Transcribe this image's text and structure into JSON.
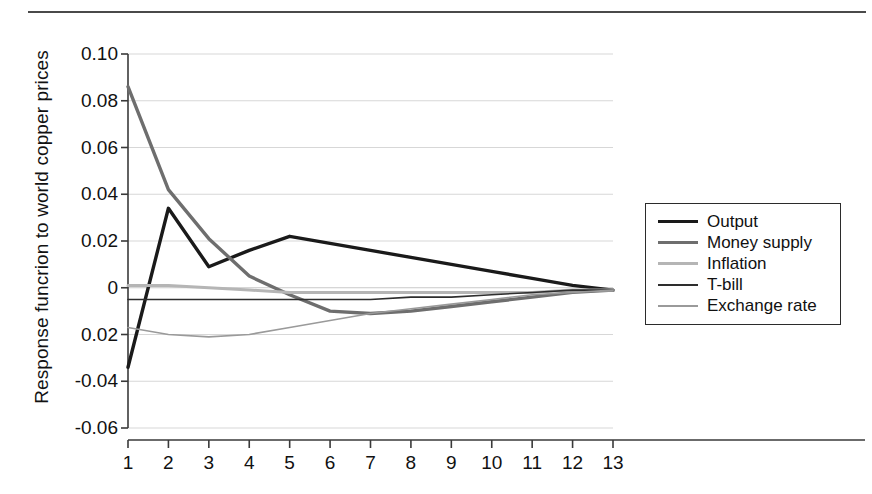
{
  "chart_data": {
    "type": "line",
    "title": "",
    "xlabel": "",
    "ylabel": "Response funcrion to world copper prices",
    "xlim": [
      1,
      13
    ],
    "ylim": [
      -0.06,
      0.1
    ],
    "grid": true,
    "legend_position": "right",
    "x": [
      1,
      2,
      3,
      4,
      5,
      6,
      7,
      8,
      9,
      10,
      11,
      12,
      13
    ],
    "xtick_labels": [
      "1",
      "2",
      "3",
      "4",
      "5",
      "6",
      "7",
      "8",
      "9",
      "10",
      "11",
      "12",
      "13"
    ],
    "ytick_labels": [
      "0.10",
      "0.08",
      "0.06",
      "0.04",
      "0.02",
      "0",
      "0.02",
      "-0.04",
      "-0.06"
    ],
    "ytick_values": [
      0.1,
      0.08,
      0.06,
      0.04,
      0.02,
      0,
      -0.02,
      -0.04,
      -0.06
    ],
    "series": [
      {
        "name": "Output",
        "color": "#1a1a1a",
        "width": 3.4,
        "values": [
          -0.034,
          0.034,
          0.009,
          0.016,
          0.022,
          0.019,
          0.016,
          0.013,
          0.01,
          0.007,
          0.004,
          0.001,
          -0.001
        ]
      },
      {
        "name": "Money supply",
        "color": "#6e6e6e",
        "width": 3.4,
        "values": [
          0.086,
          0.042,
          0.021,
          0.005,
          -0.003,
          -0.01,
          -0.011,
          -0.01,
          -0.008,
          -0.006,
          -0.004,
          -0.002,
          -0.001
        ]
      },
      {
        "name": "Inflation",
        "color": "#b5b5b5",
        "width": 3.0,
        "values": [
          0.001,
          0.001,
          0.0,
          -0.001,
          -0.002,
          -0.002,
          -0.002,
          -0.002,
          -0.002,
          -0.002,
          -0.002,
          -0.001,
          -0.001
        ]
      },
      {
        "name": "T-bill",
        "color": "#2e2e2e",
        "width": 1.6,
        "values": [
          -0.005,
          -0.005,
          -0.005,
          -0.005,
          -0.005,
          -0.005,
          -0.005,
          -0.004,
          -0.004,
          -0.003,
          -0.002,
          -0.001,
          -0.001
        ]
      },
      {
        "name": "Exchange rate",
        "color": "#9a9a9a",
        "width": 1.6,
        "values": [
          -0.017,
          -0.02,
          -0.021,
          -0.02,
          -0.017,
          -0.014,
          -0.011,
          -0.009,
          -0.007,
          -0.005,
          -0.003,
          -0.002,
          -0.001
        ]
      }
    ]
  },
  "legend": {
    "entries": [
      {
        "label": "Output"
      },
      {
        "label": "Money supply"
      },
      {
        "label": "Inflation"
      },
      {
        "label": "T-bill"
      },
      {
        "label": "Exchange rate"
      }
    ]
  },
  "axes": {
    "y_title": "Response funcrion to world copper prices"
  }
}
